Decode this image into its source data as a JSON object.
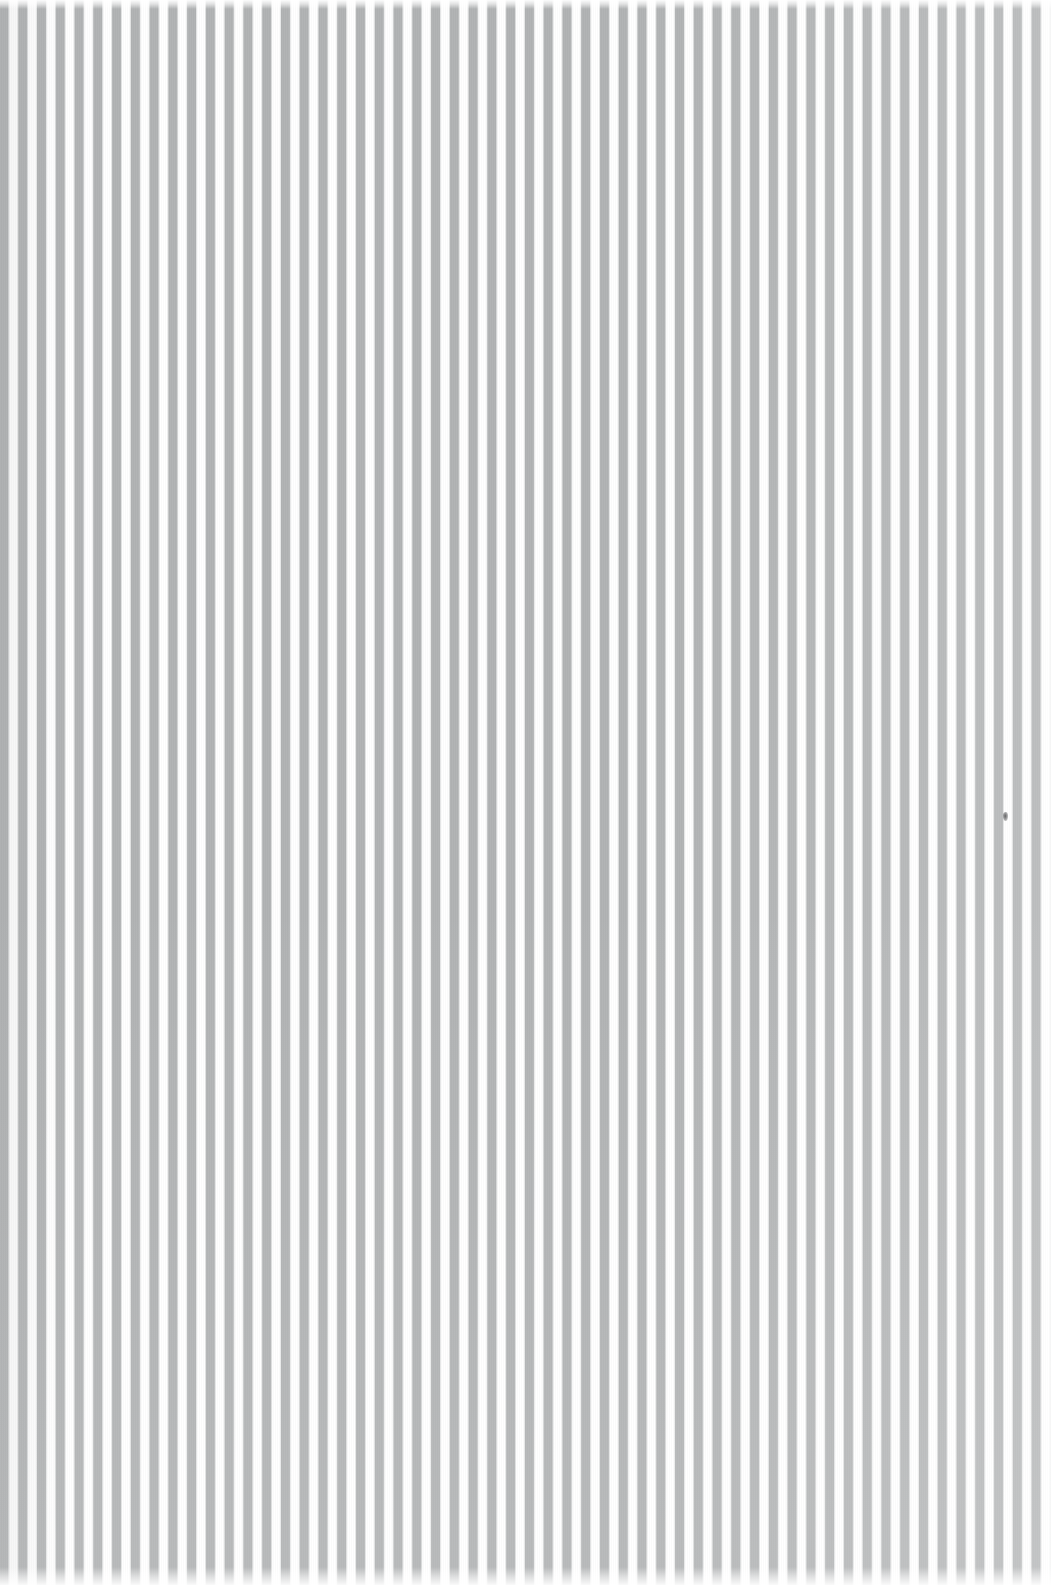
{
  "canvas": {
    "width": 1051,
    "height": 1585,
    "background_color": "#ffffff",
    "description": "Scanned sheet of vertically striped material"
  },
  "pattern": {
    "name": "vertical-stripes",
    "orientation": "vertical",
    "stripe_color": "#b2b4b5",
    "gap_color": "#ffffff",
    "period_px": 18.78,
    "stripe_width_px": 9,
    "gap_width_px": 9.8,
    "stripe_count": 56,
    "texture": "halftone-weave",
    "edge_color_left": "#a9abad"
  },
  "edges": {
    "top_fade_px": 9,
    "bottom_fade_px": 18,
    "right_margin_px": 8
  },
  "marks": [
    {
      "name": "speck",
      "x": 1003,
      "y": 812,
      "width": 5,
      "height": 9,
      "color": "#3c3c3e"
    }
  ]
}
